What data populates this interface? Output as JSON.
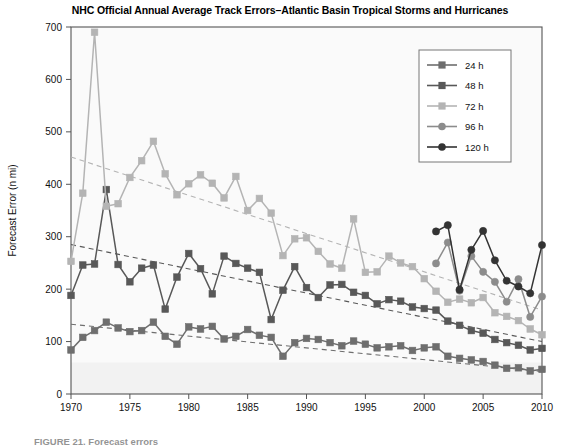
{
  "figure": {
    "title": "NHC Official Annual Average Track Errors–Atlantic Basin Tropical Storms and Hurricanes",
    "caption": "FIGURE 21. Forecast errors",
    "background": "#ffffff",
    "plot_background": "#fafafa",
    "frame_color": "#555555"
  },
  "axes": {
    "x_label": "Year",
    "y_label": "Forecast Error (n mi)",
    "x_ticks": [
      "1970",
      "1975",
      "1980",
      "1985",
      "1990",
      "1995",
      "2000",
      "2005",
      "2010"
    ],
    "y_ticks": [
      "0",
      "100",
      "200",
      "300",
      "400",
      "500",
      "600",
      "700"
    ]
  },
  "legend": {
    "position": "top-right",
    "items": [
      {
        "label": "24 h",
        "color": "#6e6e6e",
        "marker": "square"
      },
      {
        "label": "48 h",
        "color": "#585858",
        "marker": "square"
      },
      {
        "label": "72 h",
        "color": "#b4b4b4",
        "marker": "square"
      },
      {
        "label": "96 h",
        "color": "#8c8c8c",
        "marker": "circle"
      },
      {
        "label": "120 h",
        "color": "#333333",
        "marker": "circle"
      }
    ]
  },
  "chart_data": {
    "type": "line",
    "title": "NHC Official Annual Average Track Errors–Atlantic Basin Tropical Storms and Hurricanes",
    "xlabel": "Year",
    "ylabel": "Forecast Error (n mi)",
    "xlim": [
      1970,
      2010
    ],
    "ylim": [
      0,
      700
    ],
    "xticks": [
      1970,
      1975,
      1980,
      1985,
      1990,
      1995,
      2000,
      2005,
      2010
    ],
    "yticks": [
      0,
      100,
      200,
      300,
      400,
      500,
      600,
      700
    ],
    "grid": false,
    "legend_position": "top-right",
    "markers": true,
    "trendlines": [
      {
        "series": "24 h",
        "style": "dashed",
        "x": [
          1970,
          2010
        ],
        "y": [
          133,
          43
        ]
      },
      {
        "series": "48 h",
        "style": "dashed",
        "x": [
          1970,
          2010
        ],
        "y": [
          285,
          100
        ]
      },
      {
        "series": "72 h",
        "style": "dashed",
        "x": [
          1970,
          2010
        ],
        "y": [
          452,
          160
        ]
      }
    ],
    "series": [
      {
        "name": "24 h",
        "color": "#6e6e6e",
        "marker": "square",
        "x": [
          1970,
          1971,
          1972,
          1973,
          1974,
          1975,
          1976,
          1977,
          1978,
          1979,
          1980,
          1981,
          1982,
          1983,
          1984,
          1985,
          1986,
          1987,
          1988,
          1989,
          1990,
          1991,
          1992,
          1993,
          1994,
          1995,
          1996,
          1997,
          1998,
          1999,
          2000,
          2001,
          2002,
          2003,
          2004,
          2005,
          2006,
          2007,
          2008,
          2009,
          2010
        ],
        "y": [
          84,
          108,
          121,
          137,
          126,
          119,
          121,
          137,
          110,
          95,
          128,
          124,
          129,
          105,
          110,
          123,
          112,
          108,
          72,
          98,
          106,
          104,
          98,
          92,
          101,
          95,
          88,
          90,
          92,
          83,
          88,
          90,
          72,
          68,
          65,
          62,
          55,
          49,
          50,
          44,
          47
        ]
      },
      {
        "name": "48 h",
        "color": "#585858",
        "marker": "square",
        "x": [
          1970,
          1971,
          1972,
          1973,
          1974,
          1975,
          1976,
          1977,
          1978,
          1979,
          1980,
          1981,
          1982,
          1983,
          1984,
          1985,
          1986,
          1987,
          1988,
          1989,
          1990,
          1991,
          1992,
          1993,
          1994,
          1995,
          1996,
          1997,
          1998,
          1999,
          2000,
          2001,
          2002,
          2003,
          2004,
          2005,
          2006,
          2007,
          2008,
          2009,
          2010
        ],
        "y": [
          188,
          246,
          248,
          390,
          247,
          214,
          240,
          246,
          162,
          223,
          268,
          239,
          191,
          263,
          249,
          240,
          232,
          142,
          198,
          243,
          203,
          184,
          208,
          209,
          194,
          188,
          172,
          180,
          177,
          166,
          163,
          160,
          139,
          131,
          121,
          116,
          104,
          98,
          93,
          84,
          87
        ]
      },
      {
        "name": "72 h",
        "color": "#b4b4b4",
        "marker": "square",
        "x": [
          1970,
          1971,
          1972,
          1973,
          1974,
          1975,
          1976,
          1977,
          1978,
          1979,
          1980,
          1981,
          1982,
          1983,
          1984,
          1985,
          1986,
          1987,
          1988,
          1989,
          1990,
          1991,
          1992,
          1993,
          1994,
          1995,
          1996,
          1997,
          1998,
          1999,
          2000,
          2001,
          2002,
          2003,
          2004,
          2005,
          2006,
          2007,
          2008,
          2009,
          2010
        ],
        "y": [
          253,
          383,
          690,
          358,
          363,
          413,
          445,
          482,
          420,
          380,
          401,
          418,
          402,
          374,
          415,
          350,
          373,
          345,
          264,
          296,
          298,
          272,
          248,
          240,
          334,
          232,
          233,
          263,
          250,
          243,
          220,
          196,
          175,
          181,
          174,
          184,
          155,
          148,
          140,
          124,
          113
        ]
      },
      {
        "name": "96 h",
        "color": "#8c8c8c",
        "marker": "circle",
        "x": [
          2001,
          2002,
          2003,
          2004,
          2005,
          2006,
          2007,
          2008,
          2009,
          2010
        ],
        "y": [
          249,
          289,
          197,
          263,
          233,
          214,
          176,
          219,
          147,
          186
        ]
      },
      {
        "name": "120 h",
        "color": "#333333",
        "marker": "circle",
        "x": [
          2001,
          2002,
          2003,
          2004,
          2005,
          2006,
          2007,
          2008,
          2009,
          2010
        ],
        "y": [
          310,
          322,
          199,
          275,
          311,
          255,
          216,
          205,
          192,
          284
        ]
      }
    ]
  }
}
